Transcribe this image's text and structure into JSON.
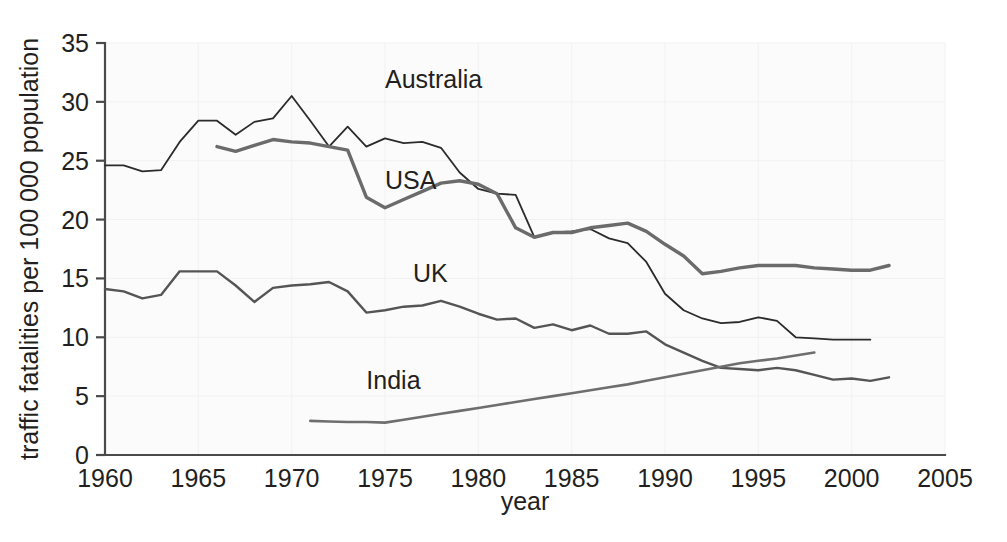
{
  "chart_data": {
    "type": "line",
    "title": "",
    "xlabel": "year",
    "ylabel": "traffic fatalities per 100 000 population",
    "xlim": [
      1960,
      2005
    ],
    "ylim": [
      0,
      35
    ],
    "xticks": [
      1960,
      1965,
      1970,
      1975,
      1980,
      1985,
      1990,
      1995,
      2000,
      2005
    ],
    "yticks": [
      0,
      5,
      10,
      15,
      20,
      25,
      30,
      35
    ],
    "grid": "faint",
    "legend": "inline-labels",
    "series": [
      {
        "name": "Australia",
        "color": "#2b2b2b",
        "stroke_width": 1.8,
        "label_x": 1975.0,
        "label_y": 31.2,
        "x": [
          1960,
          1961,
          1962,
          1963,
          1964,
          1965,
          1966,
          1967,
          1968,
          1969,
          1970,
          1971,
          1972,
          1973,
          1974,
          1975,
          1976,
          1977,
          1978,
          1979,
          1980,
          1981,
          1982,
          1983,
          1984,
          1985,
          1986,
          1987,
          1988,
          1989,
          1990,
          1991,
          1992,
          1993,
          1994,
          1995,
          1996,
          1997,
          1998,
          1999,
          2000,
          2001
        ],
        "values": [
          24.6,
          24.6,
          24.1,
          24.2,
          26.6,
          28.4,
          28.4,
          27.2,
          28.3,
          28.6,
          30.5,
          28.4,
          26.2,
          27.9,
          26.2,
          26.9,
          26.5,
          26.6,
          26.1,
          24.0,
          22.6,
          22.2,
          22.1,
          18.5,
          18.9,
          19.0,
          19.2,
          18.4,
          18.0,
          16.4,
          13.7,
          12.3,
          11.6,
          11.2,
          11.3,
          11.7,
          11.4,
          10.0,
          9.9,
          9.8,
          9.8,
          9.8
        ]
      },
      {
        "name": "USA",
        "color": "#6b6b6b",
        "stroke_width": 3.4,
        "label_x": 1975.0,
        "label_y": 22.6,
        "x": [
          1966,
          1967,
          1968,
          1969,
          1970,
          1971,
          1972,
          1973,
          1974,
          1975,
          1976,
          1977,
          1978,
          1979,
          1980,
          1981,
          1982,
          1983,
          1984,
          1985,
          1986,
          1987,
          1988,
          1989,
          1990,
          1991,
          1992,
          1993,
          1994,
          1995,
          1996,
          1997,
          1998,
          1999,
          2000,
          2001,
          2002
        ],
        "values": [
          26.2,
          25.8,
          26.3,
          26.8,
          26.6,
          26.5,
          26.2,
          25.9,
          21.9,
          21.0,
          21.7,
          22.4,
          23.1,
          23.3,
          23.0,
          22.2,
          19.3,
          18.5,
          18.9,
          18.9,
          19.3,
          19.5,
          19.7,
          19.0,
          17.9,
          16.9,
          15.4,
          15.6,
          15.9,
          16.1,
          16.1,
          16.1,
          15.9,
          15.8,
          15.7,
          15.7,
          16.1
        ]
      },
      {
        "name": "UK",
        "color": "#555555",
        "stroke_width": 2.4,
        "label_x": 1976.5,
        "label_y": 14.7,
        "x": [
          1960,
          1961,
          1962,
          1963,
          1964,
          1965,
          1966,
          1967,
          1968,
          1969,
          1970,
          1971,
          1972,
          1973,
          1974,
          1975,
          1976,
          1977,
          1978,
          1979,
          1980,
          1981,
          1982,
          1983,
          1984,
          1985,
          1986,
          1987,
          1988,
          1989,
          1990,
          1991,
          1992,
          1993,
          1994,
          1995,
          1996,
          1997,
          1998,
          1999,
          2000,
          2001,
          2002
        ],
        "values": [
          14.1,
          13.9,
          13.3,
          13.6,
          15.6,
          15.6,
          15.6,
          14.4,
          13.0,
          14.2,
          14.4,
          14.5,
          14.7,
          13.9,
          12.1,
          12.3,
          12.6,
          12.7,
          13.1,
          12.6,
          12.0,
          11.5,
          11.6,
          10.8,
          11.1,
          10.6,
          11.0,
          10.3,
          10.3,
          10.5,
          9.4,
          8.7,
          8.0,
          7.4,
          7.3,
          7.2,
          7.4,
          7.2,
          6.8,
          6.4,
          6.5,
          6.3,
          6.6
        ]
      },
      {
        "name": "India",
        "color": "#6e6e6e",
        "stroke_width": 2.6,
        "label_x": 1974.0,
        "label_y": 5.6,
        "x": [
          1971,
          1972,
          1973,
          1974,
          1975,
          1976,
          1977,
          1978,
          1979,
          1980,
          1981,
          1982,
          1983,
          1984,
          1985,
          1986,
          1987,
          1988,
          1989,
          1990,
          1991,
          1992,
          1993,
          1994,
          1995,
          1996,
          1997,
          1998
        ],
        "values": [
          2.9,
          2.85,
          2.8,
          2.8,
          2.75,
          3.0,
          3.25,
          3.5,
          3.75,
          4.0,
          4.25,
          4.5,
          4.75,
          5.0,
          5.25,
          5.5,
          5.75,
          6.0,
          6.3,
          6.6,
          6.9,
          7.2,
          7.5,
          7.8,
          8.0,
          8.2,
          8.45,
          8.7
        ]
      }
    ]
  }
}
